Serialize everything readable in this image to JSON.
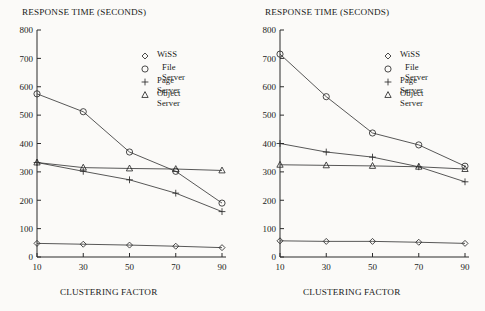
{
  "figure": {
    "background_color": "#fbfaf8",
    "ink_color": "#2b2b2b"
  },
  "panels": [
    {
      "id": "left",
      "title": "RESPONSE TIME (SECONDS)",
      "xlabel": "CLUSTERING FACTOR"
    },
    {
      "id": "right",
      "title": "RESPONSE TIME (SECONDS)",
      "xlabel": "CLUSTERING FACTOR"
    }
  ],
  "legend": {
    "entries": [
      {
        "label": "WiSS",
        "marker": "diamond-marker"
      },
      {
        "label": "File Server",
        "marker": "circle-marker"
      },
      {
        "label": "Page Server",
        "marker": "plus-marker"
      },
      {
        "label": "Object Server",
        "marker": "triangle-marker"
      }
    ]
  },
  "axis": {
    "y_ticks": [
      "0",
      "100",
      "200",
      "300",
      "400",
      "500",
      "600",
      "700",
      "800"
    ],
    "x_ticks": [
      "10",
      "30",
      "50",
      "70",
      "90"
    ]
  },
  "chart_data": [
    {
      "type": "line",
      "panel": "left",
      "title": "RESPONSE TIME (SECONDS)",
      "xlabel": "CLUSTERING FACTOR",
      "ylabel": "RESPONSE TIME (SECONDS)",
      "x": [
        10,
        30,
        50,
        70,
        90
      ],
      "xlim": [
        10,
        90
      ],
      "ylim": [
        0,
        800
      ],
      "grid": false,
      "legend_position": "upper-right",
      "series": [
        {
          "name": "WiSS",
          "marker": "diamond",
          "values": [
            48,
            45,
            42,
            38,
            33
          ]
        },
        {
          "name": "File Server",
          "marker": "circle",
          "values": [
            575,
            512,
            370,
            302,
            190
          ]
        },
        {
          "name": "Page Server",
          "marker": "plus",
          "values": [
            333,
            302,
            272,
            225,
            160
          ]
        },
        {
          "name": "Object Server",
          "marker": "triangle",
          "values": [
            333,
            315,
            312,
            310,
            305
          ]
        }
      ]
    },
    {
      "type": "line",
      "panel": "right",
      "title": "RESPONSE TIME (SECONDS)",
      "xlabel": "CLUSTERING FACTOR",
      "ylabel": "RESPONSE TIME (SECONDS)",
      "x": [
        10,
        30,
        50,
        70,
        90
      ],
      "xlim": [
        10,
        90
      ],
      "ylim": [
        0,
        800
      ],
      "grid": false,
      "legend_position": "upper-right",
      "series": [
        {
          "name": "WiSS",
          "marker": "diamond",
          "values": [
            57,
            55,
            55,
            52,
            48
          ]
        },
        {
          "name": "File Server",
          "marker": "circle",
          "values": [
            715,
            565,
            437,
            395,
            320
          ]
        },
        {
          "name": "Page Server",
          "marker": "plus",
          "values": [
            400,
            370,
            352,
            318,
            265
          ]
        },
        {
          "name": "Object Server",
          "marker": "triangle",
          "values": [
            325,
            323,
            321,
            318,
            310
          ]
        }
      ]
    }
  ]
}
